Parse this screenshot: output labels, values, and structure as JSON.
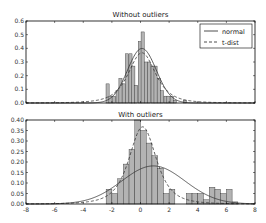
{
  "chart_data": [
    {
      "type": "bar",
      "title": "Without outliers",
      "xlabel": "",
      "ylabel": "",
      "xlim": [
        -8,
        8
      ],
      "ylim": [
        0,
        0.6
      ],
      "yticks": [
        "0.0",
        "0.1",
        "0.2",
        "0.3",
        "0.4",
        "0.5",
        "0.6"
      ],
      "xticks": [],
      "grid": false,
      "bar_width": 0.22,
      "bars": {
        "x": [
          -2.3,
          -2.1,
          -1.85,
          -1.6,
          -1.4,
          -1.15,
          -0.95,
          -0.7,
          -0.5,
          -0.3,
          -0.05,
          0.15,
          0.4,
          0.6,
          0.85,
          1.05,
          1.3,
          1.5,
          1.75,
          1.95,
          2.2,
          2.4,
          2.65,
          2.9,
          3.1
        ],
        "values": [
          0.14,
          0.05,
          0.05,
          0.09,
          0.18,
          0.14,
          0.36,
          0.36,
          0.27,
          0.13,
          0.45,
          0.52,
          0.3,
          0.3,
          0.27,
          0.27,
          0.18,
          0.09,
          0.05,
          0.05,
          0.05,
          0.02,
          0.0,
          0.0,
          0.02
        ]
      },
      "series": [
        {
          "name": "normal",
          "style": "solid",
          "mu": 0.1,
          "sigma": 1.0
        },
        {
          "name": "t-dist",
          "style": "dashed",
          "mu": 0.1,
          "sigma": 1.0
        }
      ],
      "legend": {
        "position": "upper right",
        "entries": [
          "normal",
          "t-dist"
        ]
      }
    },
    {
      "type": "bar",
      "title": "With outliers",
      "xlabel": "",
      "ylabel": "",
      "xlim": [
        -8,
        8
      ],
      "ylim": [
        0,
        0.4
      ],
      "yticks": [
        "0.00",
        "0.05",
        "0.10",
        "0.15",
        "0.20",
        "0.25",
        "0.30",
        "0.35",
        "0.40"
      ],
      "xticks": [
        "-8",
        "-6",
        "-4",
        "-2",
        "0",
        "2",
        "4",
        "6",
        "8"
      ],
      "grid": false,
      "bar_width": 0.4,
      "bars": {
        "x": [
          -2.2,
          -1.8,
          -1.4,
          -1.0,
          -0.6,
          -0.2,
          0.2,
          0.6,
          1.0,
          1.4,
          1.8,
          2.2,
          2.6,
          3.0,
          3.4,
          3.8,
          4.2,
          4.6,
          5.0,
          5.4,
          5.8,
          6.2,
          6.6
        ],
        "values": [
          0.07,
          0.05,
          0.12,
          0.19,
          0.26,
          0.4,
          0.35,
          0.29,
          0.23,
          0.17,
          0.05,
          0.07,
          0.0,
          0.0,
          0.05,
          0.05,
          0.05,
          0.02,
          0.08,
          0.07,
          0.05,
          0.07,
          0.01
        ]
      },
      "series": [
        {
          "name": "normal",
          "style": "solid",
          "mu": 0.9,
          "sigma": 2.2
        },
        {
          "name": "t-dist",
          "style": "dashed",
          "mu": 0.15,
          "sigma": 1.0
        }
      ]
    }
  ],
  "legend": {
    "normal_label": "normal",
    "tdist_label": "t-dist"
  },
  "titles": {
    "top": "Without outliers",
    "bottom": "With outliers"
  }
}
